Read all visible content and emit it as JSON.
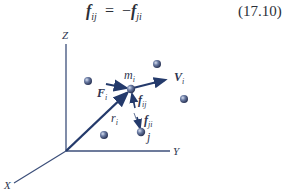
{
  "equation": {
    "lhs_symbol": "f",
    "lhs_subscript": "ij",
    "operator": "=",
    "rhs_sign": "−",
    "rhs_symbol": "f",
    "rhs_subscript": "ji",
    "number": "(17.10)"
  },
  "diagram": {
    "axes": {
      "z_label": "Z",
      "y_label": "Y",
      "x_label": "X"
    },
    "particle_i": {
      "label": "m",
      "label_sub": "i"
    },
    "particle_j": {
      "label": "j"
    },
    "vectors": {
      "force_external": {
        "label": "F",
        "sub": "i"
      },
      "velocity": {
        "label": "V",
        "sub": "i"
      },
      "position": {
        "label": "r",
        "sub": "i"
      },
      "force_ij": {
        "label": "f",
        "sub": "ij"
      },
      "force_ji": {
        "label": "f",
        "sub": "ji"
      }
    },
    "colors": {
      "vector": "#243a6b",
      "axis": "#3c4f7a",
      "particle": "#4a5a80"
    }
  }
}
